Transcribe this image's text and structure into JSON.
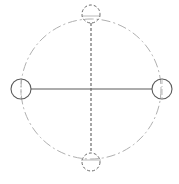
{
  "diagram": {
    "type": "circle-axis-schematic",
    "colors": {
      "background": "#ffffff",
      "outer_circle": "#b0b0b0",
      "solid_stroke": "#5a5a5a",
      "dashed_stroke": "#6a6a6a",
      "inner_tick": "#a8a8a8"
    },
    "outer_circle": {
      "cx": 91,
      "cy": 89,
      "r": 70,
      "style": "dash-dot"
    },
    "nodes": [
      {
        "id": "left",
        "cx": 21,
        "cy": 89,
        "r": 10,
        "style": "solid"
      },
      {
        "id": "right",
        "cx": 162,
        "cy": 89,
        "r": 10,
        "style": "solid"
      },
      {
        "id": "top",
        "cx": 91,
        "cy": 14,
        "r": 9,
        "style": "dashed"
      },
      {
        "id": "bottom",
        "cx": 91,
        "cy": 162,
        "r": 9,
        "style": "dashed"
      }
    ],
    "axes": [
      {
        "id": "horizontal",
        "x1": 31,
        "y1": 89,
        "x2": 152,
        "y2": 89,
        "style": "solid"
      },
      {
        "id": "vertical",
        "x1": 91,
        "y1": 23,
        "x2": 91,
        "y2": 153,
        "style": "dashed"
      }
    ]
  }
}
